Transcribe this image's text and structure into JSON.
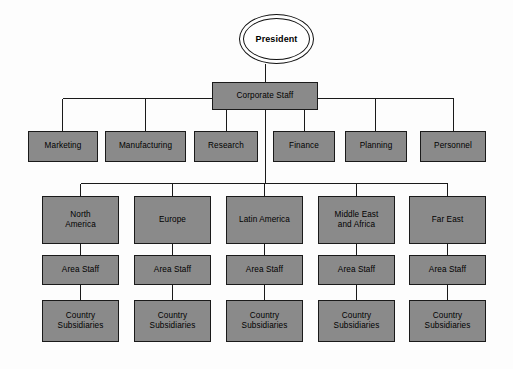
{
  "chart_data": {
    "type": "diagram",
    "orientation": "top-down",
    "node_fill_color": "#8a8a8a",
    "node_border_color": "#1a1a1a",
    "connector_color": "#1a1a1a",
    "background_color": "#fdfdfd",
    "levels": [
      "President",
      "Corporate Staff",
      "Functional Departments",
      "Geographic Areas",
      "Area Staff",
      "Country Subsidiaries"
    ]
  },
  "root": {
    "label": "President",
    "shape": "double-ellipse",
    "x": 239,
    "y": 14,
    "w": 75,
    "h": 50
  },
  "corporate_staff": {
    "label": "Corporate Staff",
    "x": 212,
    "y": 82,
    "w": 106,
    "h": 28
  },
  "departments": [
    {
      "label": "Marketing",
      "x": 28,
      "y": 131,
      "w": 70,
      "h": 31
    },
    {
      "label": "Manufacturing",
      "x": 105,
      "y": 131,
      "w": 81,
      "h": 31
    },
    {
      "label": "Research",
      "x": 194,
      "y": 131,
      "w": 64,
      "h": 31
    },
    {
      "label": "Finance",
      "x": 273,
      "y": 131,
      "w": 62,
      "h": 31
    },
    {
      "label": "Planning",
      "x": 345,
      "y": 131,
      "w": 62,
      "h": 31
    },
    {
      "label": "Personnel",
      "x": 420,
      "y": 131,
      "w": 66,
      "h": 31
    }
  ],
  "regions": [
    {
      "area": {
        "label": "North\nAmerica",
        "x": 42,
        "y": 196,
        "w": 77,
        "h": 48
      },
      "area_staff": {
        "label": "Area Staff",
        "x": 42,
        "y": 255,
        "w": 77,
        "h": 30
      },
      "subsidiary": {
        "label": "Country\nSubsidiaries",
        "x": 42,
        "y": 300,
        "w": 77,
        "h": 42
      }
    },
    {
      "area": {
        "label": "Europe",
        "x": 134,
        "y": 196,
        "w": 77,
        "h": 48
      },
      "area_staff": {
        "label": "Area Staff",
        "x": 134,
        "y": 255,
        "w": 77,
        "h": 30
      },
      "subsidiary": {
        "label": "Country\nSubsidiaries",
        "x": 134,
        "y": 300,
        "w": 77,
        "h": 42
      }
    },
    {
      "area": {
        "label": "Latin America",
        "x": 226,
        "y": 196,
        "w": 77,
        "h": 48
      },
      "area_staff": {
        "label": "Area Staff",
        "x": 226,
        "y": 255,
        "w": 77,
        "h": 30
      },
      "subsidiary": {
        "label": "Country\nSubsidiaries",
        "x": 226,
        "y": 300,
        "w": 77,
        "h": 42
      }
    },
    {
      "area": {
        "label": "Middle East\nand Africa",
        "x": 318,
        "y": 196,
        "w": 77,
        "h": 48
      },
      "area_staff": {
        "label": "Area Staff",
        "x": 318,
        "y": 255,
        "w": 77,
        "h": 30
      },
      "subsidiary": {
        "label": "Country\nSubsidiaries",
        "x": 318,
        "y": 300,
        "w": 77,
        "h": 42
      }
    },
    {
      "area": {
        "label": "Far East",
        "x": 409,
        "y": 196,
        "w": 77,
        "h": 48
      },
      "area_staff": {
        "label": "Area Staff",
        "x": 409,
        "y": 255,
        "w": 77,
        "h": 30
      },
      "subsidiary": {
        "label": "Country\nSubsidiaries",
        "x": 409,
        "y": 300,
        "w": 77,
        "h": 42
      }
    }
  ],
  "connectors": {
    "department_bus_y": 98,
    "region_bus_y": 183,
    "corporate_bottom_y": 110,
    "corporate_center_x": 265
  }
}
